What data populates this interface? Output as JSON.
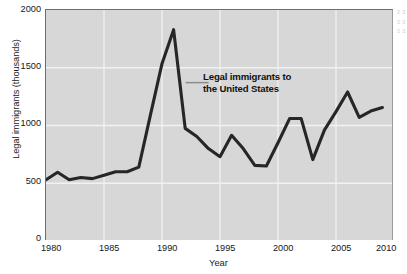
{
  "chart_data": {
    "type": "line",
    "title": "",
    "xlabel": "Year",
    "ylabel": "Legal immigrants (thousands)",
    "xlim": [
      1980,
      2010
    ],
    "ylim": [
      0,
      2000
    ],
    "grid": true,
    "legend_position": "none",
    "x_ticks": [
      "1980",
      "1985",
      "1990",
      "1995",
      "2000",
      "2005",
      "2010"
    ],
    "y_ticks": [
      "0",
      "500",
      "1000",
      "1500",
      "2000"
    ],
    "annotations": [
      {
        "text_line_1": "Legal immigrants to",
        "text_line_2": "the United States",
        "points_to_year": 1991
      }
    ],
    "series": [
      {
        "name": "Legal immigrants to the United States",
        "color": "#262626",
        "x": [
          1980,
          1981,
          1982,
          1983,
          1984,
          1985,
          1986,
          1987,
          1988,
          1989,
          1990,
          1991,
          1992,
          1993,
          1994,
          1995,
          1996,
          1997,
          1998,
          1999,
          2000,
          2001,
          2002,
          2003,
          2004,
          2005,
          2006,
          2007,
          2008,
          2009
        ],
        "values": [
          530,
          595,
          530,
          550,
          540,
          570,
          600,
          600,
          640,
          1090,
          1535,
          1830,
          975,
          905,
          800,
          730,
          915,
          800,
          655,
          650,
          850,
          1060,
          1060,
          705,
          960,
          1120,
          1290,
          1070,
          1125,
          1155
        ]
      }
    ]
  },
  "axis_labels": {
    "y_title": "Legal immigrants (thousands)",
    "x_title": "Year"
  },
  "annotation": {
    "line1": "Legal immigrants to",
    "line2": "the United States"
  },
  "colors": {
    "plot_background": "#d7d7d7",
    "gridline": "#f2f2f2",
    "line": "#262626",
    "axis": "#6d6d6d",
    "text": "#161616"
  }
}
